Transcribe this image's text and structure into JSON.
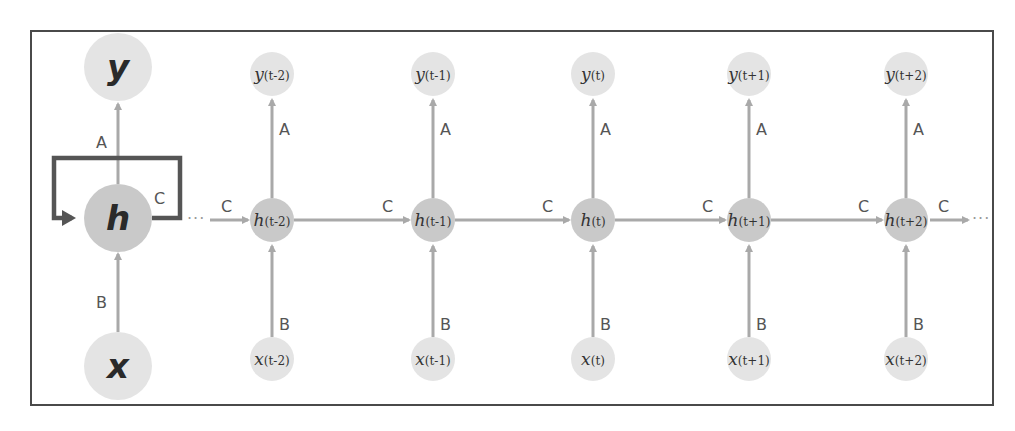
{
  "diagram": {
    "colors": {
      "frame": "#4a4a4a",
      "edge": "#a9a9a9",
      "loop": "#555555",
      "io_node": "#e4e4e4",
      "hidden_node": "#c9c9c9",
      "text": "#333333",
      "edge_label": "#555555"
    },
    "folded": {
      "output": {
        "label": "y"
      },
      "hidden": {
        "label": "h"
      },
      "input": {
        "label": "x"
      },
      "edge_output": "A",
      "edge_input": "B",
      "edge_recurrent": "C"
    },
    "unfolded": {
      "ellipsis_left": "···",
      "ellipsis_right": "···",
      "edge_output": "A",
      "edge_input": "B",
      "edge_recurrent": "C",
      "steps": [
        {
          "base_y": "y",
          "base_h": "h",
          "base_x": "x",
          "sub": "(t-2)"
        },
        {
          "base_y": "y",
          "base_h": "h",
          "base_x": "x",
          "sub": "(t-1)"
        },
        {
          "base_y": "y",
          "base_h": "h",
          "base_x": "x",
          "sub": "(t)"
        },
        {
          "base_y": "y",
          "base_h": "h",
          "base_x": "x",
          "sub": "(t+1)"
        },
        {
          "base_y": "y",
          "base_h": "h",
          "base_x": "x",
          "sub": "(t+2)"
        }
      ]
    }
  }
}
